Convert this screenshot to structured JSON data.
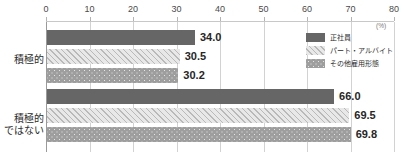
{
  "chart_data": {
    "type": "bar",
    "orientation": "horizontal",
    "title": "",
    "xlabel": "",
    "ylabel": "",
    "unit": "(%)",
    "xlim": [
      0,
      80
    ],
    "xticks": [
      "0",
      "10",
      "20",
      "30",
      "40",
      "50",
      "60",
      "70",
      "80"
    ],
    "grid": true,
    "legend_position": "top-right",
    "categories": [
      "積極的",
      "積極的\nではない"
    ],
    "series": [
      {
        "name": "正社員",
        "values": [
          34.0,
          30.5
        ],
        "pattern": "solid",
        "color": "#666666"
      },
      {
        "name": "パート・アルバイト",
        "values": [
          30.5,
          69.5
        ],
        "pattern": "hatch",
        "color": "#e2e2e2"
      },
      {
        "name": "その他雇用形態",
        "values": [
          30.2,
          69.8
        ],
        "pattern": "dots",
        "color": "#9e9e9e"
      }
    ],
    "groups": [
      {
        "category_lines": [
          "積極的"
        ],
        "bars": [
          {
            "series": "正社員",
            "value": 34.0,
            "label": "34.0",
            "pattern": "solid"
          },
          {
            "series": "パート・アルバイト",
            "value": 30.5,
            "label": "30.5",
            "pattern": "hatch"
          },
          {
            "series": "その他雇用形態",
            "value": 30.2,
            "label": "30.2",
            "pattern": "dots"
          }
        ]
      },
      {
        "category_lines": [
          "積極的",
          "ではない"
        ],
        "bars": [
          {
            "series": "正社員",
            "value": 66.0,
            "label": "66.0",
            "pattern": "solid"
          },
          {
            "series": "パート・アルバイト",
            "value": 69.5,
            "label": "69.5",
            "pattern": "hatch"
          },
          {
            "series": "その他雇用形態",
            "value": 69.8,
            "label": "69.8",
            "pattern": "dots"
          }
        ]
      }
    ]
  },
  "axis": {
    "ticks": [
      {
        "label": "0",
        "value": 0
      },
      {
        "label": "10",
        "value": 10
      },
      {
        "label": "20",
        "value": 20
      },
      {
        "label": "30",
        "value": 30
      },
      {
        "label": "40",
        "value": 40
      },
      {
        "label": "50",
        "value": 50
      },
      {
        "label": "60",
        "value": 60
      },
      {
        "label": "70",
        "value": 70
      },
      {
        "label": "80",
        "value": 80
      }
    ],
    "unit": "(%)"
  },
  "legend": {
    "items": [
      {
        "label": "正社員",
        "pattern": "solid"
      },
      {
        "label": "パート・アルバイト",
        "pattern": "hatch"
      },
      {
        "label": "その他雇用形態",
        "pattern": "dots"
      }
    ]
  },
  "categories": {
    "group1_line1": "積極的",
    "group2_line1": "積極的",
    "group2_line2": "ではない"
  }
}
